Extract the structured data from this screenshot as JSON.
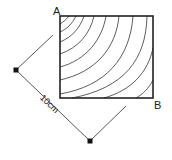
{
  "diagram": {
    "type": "geometry-figure",
    "labels": {
      "corner_top_left": "A",
      "corner_bottom_right": "B",
      "dimension": "10cm"
    },
    "colors": {
      "stroke": "#222222",
      "contour": "#333333",
      "background": "#ffffff"
    },
    "contour_count": 9
  }
}
